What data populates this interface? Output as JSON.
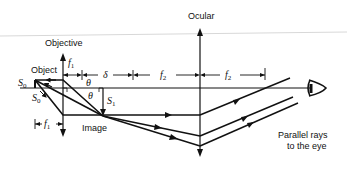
{
  "diagram": {
    "labels": {
      "ocular": "Ocular",
      "objective": "Objective",
      "object": "Object",
      "image": "Image",
      "parallel_rays_line1": "Parallel rays",
      "parallel_rays_line2": "to the eye"
    },
    "symbols": {
      "S0": "S",
      "S0_sub": "0",
      "S0_prime": "S",
      "S0_prime_sub": "0",
      "S1": "S",
      "S1_sub": "1",
      "f1_top": "f",
      "f1_top_sub": "1",
      "f1_bottom": "f",
      "f1_bottom_sub": "1",
      "delta": "δ",
      "f2_first": "f",
      "f2_first_sub": "2",
      "f2_second": "f",
      "f2_second_sub": "2",
      "theta_1": "θ",
      "theta_2": "θ"
    },
    "colors": {
      "line": "#111111",
      "background": "#ffffff",
      "top_rule": "#d8d8d8"
    }
  }
}
